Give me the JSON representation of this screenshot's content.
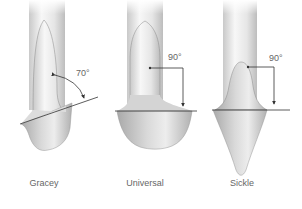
{
  "figure": {
    "instruments": [
      {
        "name": "Gracey",
        "angle": "70°"
      },
      {
        "name": "Universal",
        "angle": "90°"
      },
      {
        "name": "Sickle",
        "angle": "90°"
      }
    ]
  },
  "colors": {
    "shaft_light": "#f4f4f4",
    "shaft_mid": "#d8d8d8",
    "shaft_dark": "#b5b5b5",
    "line": "#333333",
    "text": "#666666"
  }
}
